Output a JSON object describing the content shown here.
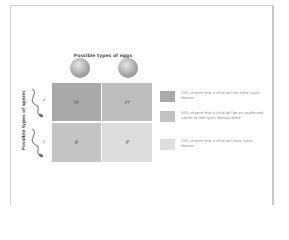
{
  "diagram": {
    "title": "Possible types of eggs",
    "side_label": "Possible types of sperm",
    "eggs": [
      {
        "allele": "F"
      },
      {
        "allele": "f"
      }
    ],
    "sperm": [
      {
        "allele": "F"
      },
      {
        "allele": "f"
      }
    ],
    "cells": [
      {
        "genotype": "FF",
        "color": "#a9a9a9"
      },
      {
        "genotype": "Ff",
        "color": "#bdbdbd"
      },
      {
        "genotype": "fF",
        "color": "#c4c4c4"
      },
      {
        "genotype": "ff",
        "color": "#dcdcdc"
      }
    ],
    "legend": [
      {
        "color": "#a9a9a9",
        "text": "25% chance that a child will not have cystic fibrosis"
      },
      {
        "color": "#c2c2c2",
        "text": "50% chance that a child will be an unaffected carrier of the cystic fibrosis allele"
      },
      {
        "color": "#dedede",
        "text": "25% chance that a child will have cystic fibrosis"
      }
    ]
  }
}
